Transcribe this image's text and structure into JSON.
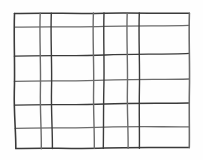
{
  "figure": {
    "background_color": "#fefefe",
    "line_color": "#3a3a3a",
    "line_color_light": "#6b6b6b",
    "stroke_width": 1.4,
    "canvas": {
      "width": 203,
      "height": 160
    }
  },
  "chart_data": {
    "type": "line",
    "title": "",
    "xlabel": "",
    "ylabel": "",
    "grid": true,
    "legend_position": "none",
    "xlim": [
      0,
      203
    ],
    "ylim": [
      0,
      160
    ],
    "vertical_lines": [
      {
        "name": "v1",
        "x_top": 14,
        "x_bottom": 16
      },
      {
        "name": "v2",
        "x_top": 40,
        "x_bottom": 41
      },
      {
        "name": "v3",
        "x_top": 51,
        "x_bottom": 52
      },
      {
        "name": "v4",
        "x_top": 93,
        "x_bottom": 94
      },
      {
        "name": "v5",
        "x_top": 104,
        "x_bottom": 103
      },
      {
        "name": "v6",
        "x_top": 127,
        "x_bottom": 128
      },
      {
        "name": "v7",
        "x_top": 139,
        "x_bottom": 139
      },
      {
        "name": "v8",
        "x_top": 189,
        "x_bottom": 189
      }
    ],
    "horizontal_lines": [
      {
        "name": "h1",
        "y_left": 13,
        "y_right": 13
      },
      {
        "name": "h2",
        "y_left": 27,
        "y_right": 25
      },
      {
        "name": "h3",
        "y_left": 56,
        "y_right": 53
      },
      {
        "name": "h4",
        "y_left": 81,
        "y_right": 79
      },
      {
        "name": "h5",
        "y_left": 105,
        "y_right": 103
      },
      {
        "name": "h6",
        "y_left": 128,
        "y_right": 127
      },
      {
        "name": "h7",
        "y_left": 148,
        "y_right": 147
      }
    ],
    "counts": {
      "vertical": 8,
      "horizontal": 7,
      "cells": 42
    }
  },
  "paths": {
    "vertical": [
      "M 14.5 13.5 C 13.6 40 15.2 66 14.3 92 C 13.8 114 16.0 132 15.8 148.5",
      "M 40.2 13.2 C 39.3 38 41.0 64 40.4 90 C 40.0 112 41.6 132 41.3 148.8",
      "M 51.3 13.1 C 50.4 38 52.2 64 51.5 90 C 51.1 112 52.6 132 52.4 148.6",
      "M 93.4 13.0 C 92.4 38 94.2 64 93.6 90 C 93.2 112 94.6 132 94.3 148.4",
      "M 104.0 13.0 C 103.2 38 104.6 64 103.8 90 C 103.4 112 103.6 132 103.3 148.4",
      "M 127.2 12.9 C 126.3 38 128.0 64 127.4 90 C 127.0 112 128.4 132 128.1 148.2",
      "M 139.3 12.9 C 138.4 38 140.0 64 139.4 90 C 139.0 112 139.6 132 139.4 148.2",
      "M 189.4 13.2 C 188.6 38 190.0 64 189.4 90 C 189.0 112 189.6 132 189.3 147.6"
    ],
    "horizontal": [
      "M 14.4 13.6 C 45 12.6 75 14.0 105 13.2 C 135 12.6 165 13.8 189.4 13.2",
      "M 14.6 27.2 C 45 26.2 75 27.4 105 26.4 C 135 25.4 165 26.2 189.3 25.4",
      "M 14.4 56.2 C 45 55.0 75 56.4 105 55.0 C 135 53.8 165 54.6 189.3 53.4",
      "M 14.4 81.4 C 45 80.2 75 81.6 105 80.2 C 135 79.0 165 79.8 189.3 79.0",
      "M 14.5 105.2 C 45 104.0 75 105.4 105 104.0 C 135 102.8 165 103.6 189.3 103.0",
      "M 15.2 128.4 C 45 127.2 75 128.6 105 127.2 C 135 126.2 165 127.0 189.3 126.8",
      "M 15.8 148.6 C 45 147.8 75 149.0 105 148.0 C 135 147.0 165 147.8 189.3 147.4"
    ]
  }
}
